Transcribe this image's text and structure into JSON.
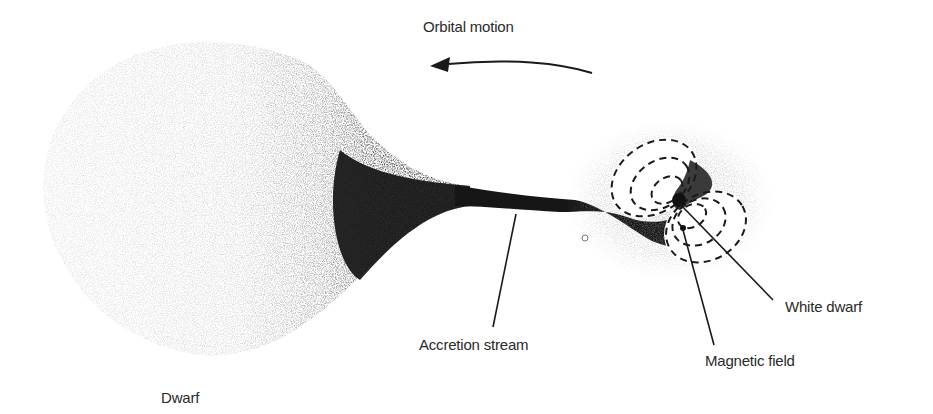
{
  "diagram": {
    "type": "accretion-binary-illustration",
    "labels": {
      "orbital_motion": "Orbital motion",
      "accretion_stream": "Accretion stream",
      "white_dwarf": "White dwarf",
      "magnetic_field": "Magnetic field",
      "dwarf": "Dwarf"
    },
    "components": [
      {
        "id": "dwarf",
        "label": "Dwarf",
        "shape": "teardrop lobe",
        "shading": "speckled gray gradient, darkening toward stream"
      },
      {
        "id": "accretion_stream",
        "label": "Accretion stream",
        "shape": "narrow dark neck connecting lobes"
      },
      {
        "id": "white_dwarf",
        "label": "White dwarf",
        "shape": "small dark dot at center of field lobes"
      },
      {
        "id": "magnetic_field",
        "label": "Magnetic field",
        "shape": "two sets of nested dashed ellipses (dipole lobes)"
      },
      {
        "id": "orbital_motion",
        "label": "Orbital motion",
        "shape": "curved arrow pointing left"
      }
    ],
    "colors": {
      "ink": "#1a1a1a",
      "text": "#2a2a2a",
      "background": "#ffffff",
      "speckle": "#9a9a9a"
    }
  }
}
